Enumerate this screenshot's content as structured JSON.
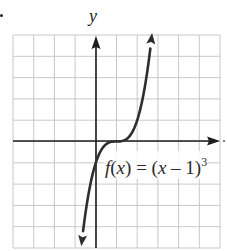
{
  "problem_marker": "•",
  "axes": {
    "y_label": "y",
    "x_label": ""
  },
  "function_label": {
    "f": "f",
    "open": "(",
    "var": "x",
    "close": ")",
    "eq": " = (",
    "var2": "x",
    "minus": " – 1)",
    "exp": "3"
  },
  "colors": {
    "grid": "#c8c8c8",
    "axis": "#1e1e1e",
    "curve": "#2e2e2e"
  },
  "chart_data": {
    "type": "line",
    "title": "",
    "equation": "f(x) = (x - 1)^3",
    "xlabel": "x",
    "ylabel": "y",
    "xlim": [
      -4,
      6
    ],
    "ylim": [
      -5,
      5
    ],
    "grid": true,
    "grid_step": 1,
    "legend": null,
    "annotations": [
      {
        "text": "f(x) = (x − 1)^3",
        "x": 1.1,
        "y": -1.5
      }
    ],
    "series": [
      {
        "name": "f(x) = (x − 1)^3",
        "x": [
          -0.7,
          -0.5,
          0,
          0.5,
          1,
          1.5,
          2,
          2.5,
          2.72
        ],
        "y": [
          -4.91,
          -3.375,
          -1,
          -0.125,
          0,
          0.125,
          1,
          3.375,
          5.09
        ],
        "arrows": "both"
      }
    ]
  }
}
